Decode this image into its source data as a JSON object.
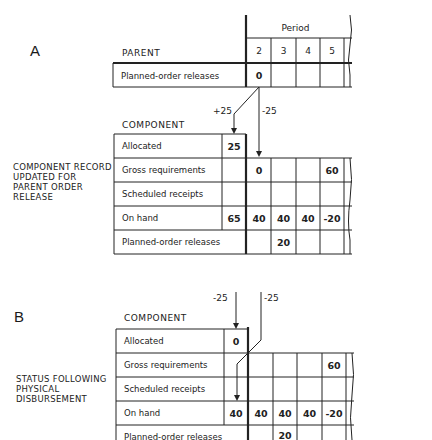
{
  "panel_a": {
    "letter": "A",
    "caption": "COMPONENT RECORD\nUPDATED FOR\nPARENT ORDER\nRELEASE",
    "parent_heading": "PARENT",
    "period_heading": "Period",
    "periods": [
      "2",
      "3",
      "4",
      "5"
    ],
    "parent_row": {
      "label": "Planned-order releases",
      "values": [
        "0",
        "",
        "",
        ""
      ]
    },
    "component_heading": "COMPONENT",
    "arrow_labels": {
      "allocated": "+25",
      "gross": "-25"
    },
    "rows": [
      {
        "label": "Allocated",
        "pre": "25",
        "values": null
      },
      {
        "label": "Gross requirements",
        "pre": "",
        "values": [
          "0",
          "",
          "",
          "60"
        ]
      },
      {
        "label": "Scheduled receipts",
        "pre": "",
        "values": [
          "",
          "",
          "",
          ""
        ]
      },
      {
        "label": "On hand",
        "pre": "65",
        "values": [
          "40",
          "40",
          "40",
          "-20"
        ]
      },
      {
        "label": "Planned-order releases",
        "pre": null,
        "values": [
          "",
          "20",
          "",
          ""
        ]
      }
    ]
  },
  "panel_b": {
    "letter": "B",
    "caption": "STATUS FOLLOWING\nPHYSICAL\nDISBURSEMENT",
    "component_heading": "COMPONENT",
    "arrow_labels": {
      "allocated": "-25",
      "on_hand": "-25"
    },
    "rows": [
      {
        "label": "Allocated",
        "pre": "0",
        "values": null
      },
      {
        "label": "Gross requirements",
        "pre": "",
        "values": [
          "",
          "",
          "",
          "60"
        ]
      },
      {
        "label": "Scheduled receipts",
        "pre": "",
        "values": [
          "",
          "",
          "",
          ""
        ]
      },
      {
        "label": "On hand",
        "pre": "40",
        "values": [
          "40",
          "40",
          "40",
          "-20"
        ]
      },
      {
        "label": "Planned-order releases",
        "pre": null,
        "values": [
          "",
          "20",
          "",
          ""
        ]
      }
    ]
  },
  "colors": {
    "ink": "#222222",
    "paper": "#ffffff"
  }
}
